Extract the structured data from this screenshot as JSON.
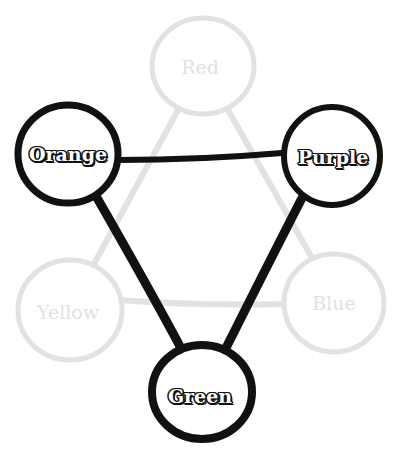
{
  "diagram": {
    "type": "color-wheel-triangle",
    "nodes": [
      {
        "id": "red",
        "label": "Red",
        "x": 203,
        "y": 66,
        "r": 50,
        "style": "faded"
      },
      {
        "id": "orange",
        "label": "Orange",
        "x": 68,
        "y": 154,
        "r": 50,
        "style": "bold"
      },
      {
        "id": "purple",
        "label": "Purple",
        "x": 332,
        "y": 156,
        "r": 50,
        "style": "bold"
      },
      {
        "id": "yellow",
        "label": "Yellow",
        "x": 70,
        "y": 310,
        "r": 50,
        "style": "faded"
      },
      {
        "id": "blue",
        "label": "Blue",
        "x": 334,
        "y": 303,
        "r": 50,
        "style": "faded"
      },
      {
        "id": "green",
        "label": "Green",
        "x": 200,
        "y": 392,
        "r": 50,
        "style": "bold"
      }
    ],
    "edges_faded": [
      [
        "red",
        "yellow"
      ],
      [
        "red",
        "blue"
      ],
      [
        "yellow",
        "blue"
      ]
    ],
    "edges_bold": [
      [
        "orange",
        "purple"
      ],
      [
        "orange",
        "green"
      ],
      [
        "purple",
        "green"
      ]
    ],
    "colors": {
      "bold": "#111111",
      "faded": "#e2e2e2",
      "background": "#ffffff"
    }
  }
}
